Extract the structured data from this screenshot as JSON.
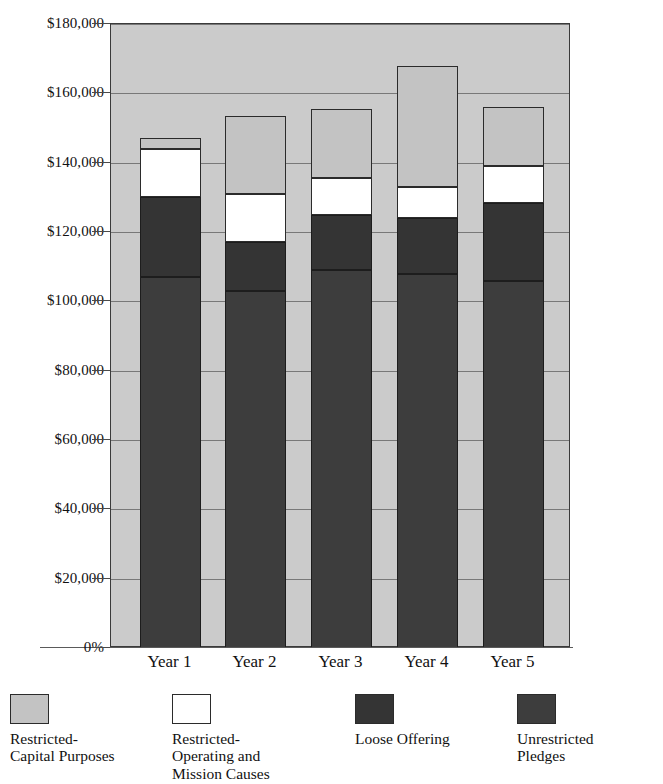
{
  "chart_data": {
    "type": "bar",
    "subtype": "stacked-column",
    "title": "",
    "xlabel": "",
    "ylabel": "",
    "categories": [
      "Year 1",
      "Year 2",
      "Year 3",
      "Year 4",
      "Year 5"
    ],
    "ylim": [
      0,
      180000
    ],
    "ytick_labels": [
      "$180,000",
      "$160,000",
      "$140,000",
      "$120,000",
      "$100,000",
      "$80,000",
      "$60,000",
      "$40,000",
      "$20,000",
      "0%"
    ],
    "ytick_values": [
      180000,
      160000,
      140000,
      120000,
      100000,
      80000,
      60000,
      40000,
      20000,
      0
    ],
    "grid": true,
    "legend_position": "bottom",
    "series": [
      {
        "name": "Unrestricted Pledges",
        "color": "#3d3d3d",
        "values": [
          107000,
          103000,
          109000,
          108000,
          106000
        ]
      },
      {
        "name": "Loose Offering",
        "color": "#343434",
        "values": [
          23000,
          14000,
          16000,
          16000,
          22500
        ]
      },
      {
        "name": "Restricted-Operating and Mission Causes",
        "color": "#ffffff",
        "values": [
          14000,
          14000,
          10500,
          9000,
          10500
        ]
      },
      {
        "name": "Restricted-Capital Purposes",
        "color": "#c3c3c3",
        "values": [
          3000,
          22500,
          20000,
          35000,
          17000
        ]
      }
    ],
    "totals": [
      147000,
      153500,
      155500,
      168000,
      156000
    ]
  },
  "yaxis": {
    "ticks": [
      {
        "label": "$180,000",
        "value": 180000
      },
      {
        "label": "$160,000",
        "value": 160000
      },
      {
        "label": "$140,000",
        "value": 140000
      },
      {
        "label": "$120,000",
        "value": 120000
      },
      {
        "label": "$100,000",
        "value": 100000
      },
      {
        "label": "$80,000",
        "value": 80000
      },
      {
        "label": "$60,000",
        "value": 60000
      },
      {
        "label": "$40,000",
        "value": 40000
      },
      {
        "label": "$20,000",
        "value": 20000
      },
      {
        "label": "0%",
        "value": 0
      }
    ]
  },
  "xaxis": {
    "labels": [
      "Year 1",
      "Year 2",
      "Year 3",
      "Year 4",
      "Year 5"
    ]
  },
  "legend": {
    "items": [
      {
        "label": "Restricted-\nCapital Purposes",
        "color": "#c3c3c3",
        "swatch": "capital"
      },
      {
        "label": "Restricted-\nOperating and\nMission Causes",
        "color": "#ffffff",
        "swatch": "operating"
      },
      {
        "label": "Loose Offering",
        "color": "#343434",
        "swatch": "loose"
      },
      {
        "label": "Unrestricted\nPledges",
        "color": "#3d3d3d",
        "swatch": "pledges"
      }
    ]
  },
  "colors": {
    "capital": "#c3c3c3",
    "operating": "#ffffff",
    "loose": "#343434",
    "pledges": "#3d3d3d",
    "plot_background": "#cbcbcb",
    "gridline": "#6a6a6a",
    "text": "#111111"
  }
}
